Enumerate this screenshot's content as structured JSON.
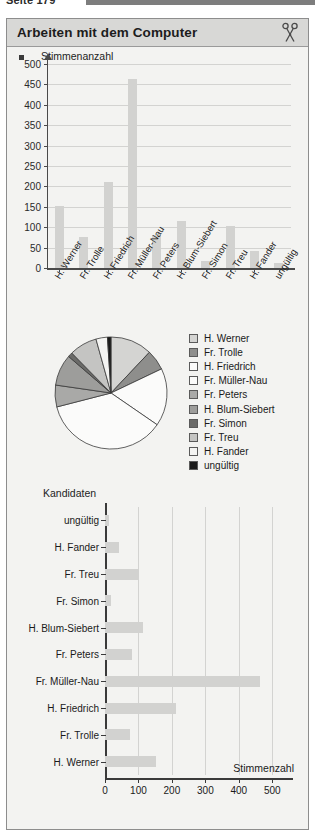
{
  "running_head": {
    "text": "Seite 179"
  },
  "header": {
    "title": "Arbeiten mit dem Computer",
    "icon": "scissors-icon"
  },
  "colors": {
    "panel_header_bg": "#d8d8d6",
    "panel_bg": "#f3f3f1",
    "bar_fill": "#d2d2d0",
    "axis": "#3a3a3a",
    "grid": "#d3d3d1"
  },
  "chart_data": [
    {
      "type": "bar",
      "id": "vertical-bar-chart",
      "title": "",
      "ylabel": "Stimmenanzahl",
      "xlabel": "",
      "ylim": [
        0,
        500
      ],
      "yticks": [
        0,
        50,
        100,
        150,
        200,
        250,
        300,
        350,
        400,
        450,
        500
      ],
      "grid": true,
      "categories": [
        "H. Werner",
        "Fr. Trolle",
        "H. Friedrich",
        "Fr. Müller-Nau",
        "Fr. Peters",
        "H. Blum-Siebert",
        "Fr. Simon",
        "Fr. Treu",
        "H. Fander",
        "ungültig"
      ],
      "values": [
        153,
        75,
        212,
        463,
        80,
        115,
        17,
        102,
        42,
        13
      ]
    },
    {
      "type": "pie",
      "id": "pie-chart",
      "title": "",
      "legend_position": "right",
      "labels": [
        "H. Werner",
        "Fr. Trolle",
        "H. Friedrich",
        "Fr. Müller-Nau",
        "Fr. Peters",
        "H. Blum-Siebert",
        "Fr. Simon",
        "Fr. Treu",
        "H. Fander",
        "ungültig"
      ],
      "values": [
        153,
        75,
        212,
        463,
        80,
        115,
        17,
        102,
        42,
        13
      ],
      "slice_colors": [
        "#d4d4d2",
        "#8e8e8c",
        "#fbfbfa",
        "#fbfbfa",
        "#a9a9a7",
        "#9d9d9b",
        "#6a6a68",
        "#c4c4c2",
        "#f4f4f2",
        "#1a1a1a"
      ]
    },
    {
      "type": "bar",
      "id": "horizontal-bar-chart",
      "orientation": "horizontal",
      "title": "",
      "ylabel": "Kandidaten",
      "xlabel": "Stimmenzahl",
      "xlim": [
        0,
        550
      ],
      "xticks": [
        0,
        100,
        200,
        300,
        400,
        500
      ],
      "grid": true,
      "categories": [
        "ungültig",
        "H. Fander",
        "Fr. Treu",
        "Fr. Simon",
        "H. Blum-Siebert",
        "Fr. Peters",
        "Fr. Müller-Nau",
        "H. Friedrich",
        "Fr. Trolle",
        "H. Werner"
      ],
      "values": [
        13,
        42,
        102,
        17,
        115,
        80,
        463,
        212,
        75,
        153
      ]
    }
  ]
}
